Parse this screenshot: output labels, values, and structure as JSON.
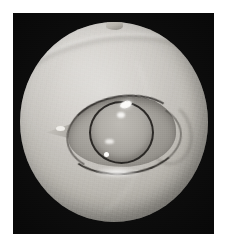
{
  "page": {
    "background_color": "#ffffff",
    "width_px": 227,
    "height_px": 249
  },
  "photo": {
    "alt_text": "Grayscale macro photograph of an eye on a black background",
    "frame_color": "#070707",
    "frame_left_px": 13,
    "frame_top_px": 13,
    "frame_width_px": 201,
    "frame_height_px": 221,
    "color_mode": "grayscale"
  },
  "subject": {
    "globe_label": "eyeball globe",
    "globe_center_x_px": 114,
    "globe_center_y_px": 122,
    "globe_color_light": "#d8d6d2",
    "globe_color_mid": "#b0ada6",
    "globe_color_dark": "#4a4743",
    "nub_label": "apical papilla",
    "eye_aperture_label": "lid aperture",
    "aperture_color": "#a6a39d",
    "upper_lid_label": "upper eyelid margin",
    "lower_lid_label": "lower eyelid margin",
    "lid_margin_color": "#262421",
    "pupil_label": "lens and pupil",
    "pupil_color": "#b2afa9",
    "pupil_rim_color": "#1a1816",
    "canthus_label": "medial canthus",
    "highlight_color": "#fbfaf8",
    "crease_label": "periocular fold"
  }
}
